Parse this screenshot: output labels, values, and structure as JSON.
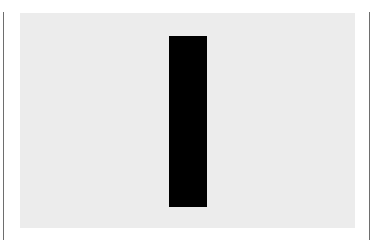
{
  "figure": {
    "panel_color": "#ececec",
    "bar_color": "#000000",
    "line_color": "#6e6e6e",
    "shape": "vertical-black-bar"
  }
}
